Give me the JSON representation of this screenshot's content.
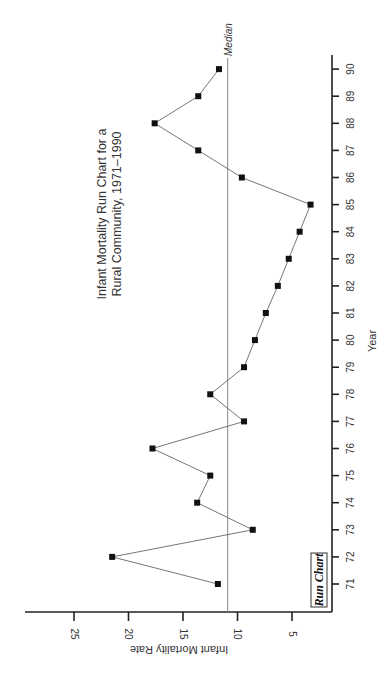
{
  "chart_data": {
    "type": "line",
    "orientation": "rotated-90-clockwise",
    "title": "Infant Mortality Run Chart for a Rural Community, 1971–1990",
    "title_lines": [
      "Infant Mortality Run Chart for a",
      "Rural Community, 1971–1990"
    ],
    "xlabel": "Year",
    "ylabel": "Infant Mortality Rate",
    "x_ticks": [
      "71",
      "72",
      "73",
      "74",
      "75",
      "76",
      "77",
      "78",
      "79",
      "80",
      "81",
      "82",
      "83",
      "84",
      "85",
      "86",
      "87",
      "88",
      "89",
      "90"
    ],
    "y_ticks": [
      5,
      10,
      15,
      20,
      25
    ],
    "ylim": [
      0,
      29
    ],
    "grid": false,
    "legend": null,
    "badge": "Run Chart",
    "median": {
      "label": "Median",
      "value": 10.9
    },
    "series": [
      {
        "name": "Infant Mortality Rate",
        "marker": "square",
        "x": [
          71,
          72,
          73,
          74,
          75,
          76,
          77,
          78,
          79,
          80,
          81,
          82,
          83,
          84,
          85,
          86,
          87,
          88,
          89,
          90
        ],
        "values": [
          11.8,
          21.5,
          8.6,
          13.7,
          12.5,
          17.8,
          9.4,
          12.5,
          9.4,
          8.4,
          7.4,
          6.3,
          5.3,
          4.3,
          3.3,
          9.6,
          13.6,
          17.6,
          13.6,
          11.7
        ]
      }
    ]
  }
}
